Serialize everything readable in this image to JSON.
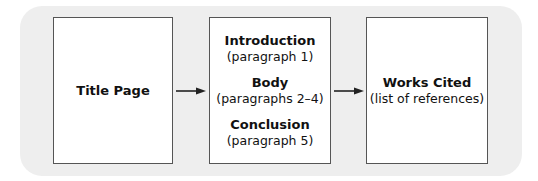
{
  "diagram": {
    "title_page": {
      "label": "Title Page"
    },
    "middle": [
      {
        "label": "Introduction",
        "sub": "(paragraph 1)"
      },
      {
        "label": "Body",
        "sub": "(paragraphs 2–4)"
      },
      {
        "label": "Conclusion",
        "sub": "(paragraph 5)"
      }
    ],
    "works_cited": {
      "label": "Works Cited",
      "sub": "(list of references)"
    },
    "colors": {
      "panel": "#eeeeee",
      "box_border": "#555555",
      "arrow": "#222222"
    }
  }
}
